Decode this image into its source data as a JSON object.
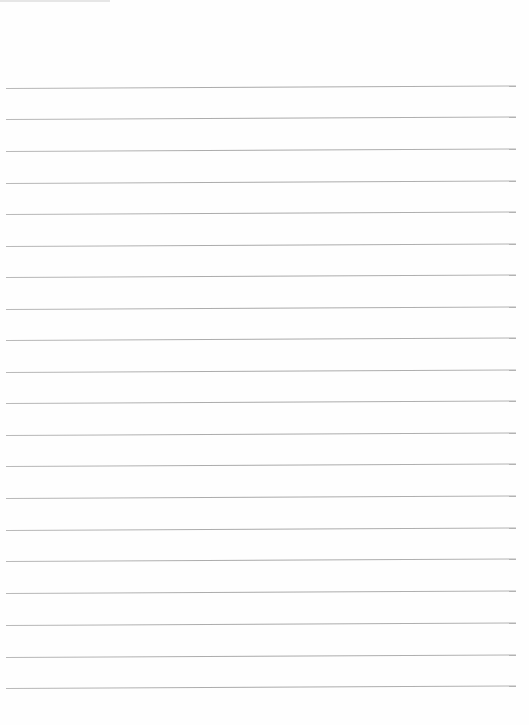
{
  "page": {
    "type": "lined-paper",
    "background": "#fefefe",
    "line_color": "#b0b0b0",
    "line_count": 20,
    "line_positions_y": [
      88,
      119,
      151,
      183,
      214,
      246,
      277,
      309,
      340,
      372,
      403,
      435,
      466,
      498,
      530,
      561,
      593,
      625,
      657,
      688
    ]
  }
}
